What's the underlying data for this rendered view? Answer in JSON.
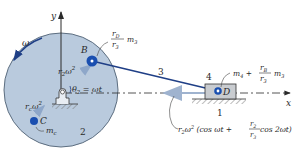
{
  "diagram": {
    "type": "slider-crank mechanism",
    "colors": {
      "crank_fill": "#b9cadd",
      "crank_stroke": "#5d6e80",
      "link_color": "#1f3f86",
      "point_color": "#1a4fb0",
      "arrow_light": "#9fb3cf",
      "slider_fill": "#c9ccd0",
      "text": "#2a2a2a"
    },
    "axes": {
      "y_label": "y",
      "x_label": "x"
    },
    "rotation": {
      "omega_label": "ω"
    },
    "crank": {
      "link_number": "2",
      "angle_label_theta": "θ",
      "angle_label_sub": "2",
      "angle_label_rhs": " = ωt",
      "accel_B_label_r": "r",
      "accel_B_label_sub": "2",
      "accel_B_label_w": "ω",
      "accel_B_label_sup": "2"
    },
    "point_B": {
      "label": "B",
      "mass_num_r": "r",
      "mass_num_sub": "D",
      "mass_den_r": "r",
      "mass_den_sub": "3",
      "mass_m": "m",
      "mass_m_sub": "3"
    },
    "point_C": {
      "label": "C",
      "accel_r": "r",
      "accel_sub": "c",
      "accel_w": "ω",
      "accel_sup": "2",
      "mass_m": "m",
      "mass_sub": "c"
    },
    "link_3": {
      "number": "3"
    },
    "slider": {
      "number": "4",
      "point_label": "D",
      "mass_m4": "m",
      "mass_m4_sub": "4",
      "mass_plus": " + ",
      "mass_num_r": "r",
      "mass_num_sub": "B",
      "mass_den_r": "r",
      "mass_den_sub": "3",
      "mass_m3": "m",
      "mass_m3_sub": "3"
    },
    "ground": {
      "number": "1"
    },
    "slider_accel": {
      "prefix_r": "r",
      "prefix_sub": "2",
      "prefix_w": "ω",
      "prefix_sup": "2",
      "open": " (cos ωt + ",
      "frac_num_r": "r",
      "frac_num_sub": "2",
      "frac_den_r": "r",
      "frac_den_sub": "3",
      "close": " cos 2ωt)"
    }
  }
}
